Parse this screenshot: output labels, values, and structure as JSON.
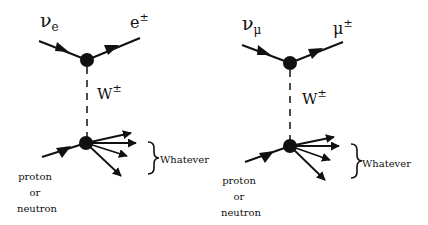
{
  "diagrams": [
    {
      "name": "electron-neutrino",
      "incoming_lepton": {
        "base": "ν",
        "sub": "e"
      },
      "outgoing_lepton": {
        "base": "e",
        "sup": "±"
      },
      "boson": {
        "base": "W",
        "sup": "±"
      },
      "target_label": [
        "proton",
        "or",
        "neutron"
      ],
      "products_label": "Whatever"
    },
    {
      "name": "muon-neutrino",
      "incoming_lepton": {
        "base": "ν",
        "sub": "μ"
      },
      "outgoing_lepton": {
        "base": "μ",
        "sup": "±"
      },
      "boson": {
        "base": "W",
        "sup": "±"
      },
      "target_label": [
        "proton",
        "or",
        "neutron"
      ],
      "products_label": "Whatever"
    }
  ],
  "colors": {
    "line": "#111111",
    "background": "#ffffff"
  }
}
